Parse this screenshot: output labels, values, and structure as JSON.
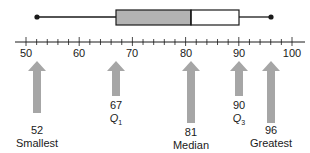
{
  "chart_data": {
    "type": "boxplot",
    "title": "",
    "axis": {
      "min": 50,
      "max": 100,
      "major_ticks": [
        50,
        60,
        70,
        80,
        90,
        100
      ],
      "minor_step": 2
    },
    "five_number_summary": {
      "smallest": 52,
      "q1": 67,
      "median": 81,
      "q3": 90,
      "greatest": 96
    },
    "annotations": [
      {
        "value": 52,
        "label": "Smallest"
      },
      {
        "value": 67,
        "label": "Q1"
      },
      {
        "value": 81,
        "label": "Median"
      },
      {
        "value": 90,
        "label": "Q3"
      },
      {
        "value": 96,
        "label": "Greatest"
      }
    ]
  },
  "colors": {
    "box_shaded": "#b3b3b3",
    "box_unshaded": "#ffffff",
    "arrow": "#a6a6a6",
    "line": "#1a1a1a"
  },
  "labels": {
    "smallest": {
      "value": "52",
      "name": "Smallest"
    },
    "q1": {
      "value": "67",
      "name": "Q",
      "sub": "1"
    },
    "median": {
      "value": "81",
      "name": "Median"
    },
    "q3": {
      "value": "90",
      "name": "Q",
      "sub": "3"
    },
    "greatest": {
      "value": "96",
      "name": "Greatest"
    }
  },
  "ticks": [
    "50",
    "60",
    "70",
    "80",
    "90",
    "100"
  ]
}
